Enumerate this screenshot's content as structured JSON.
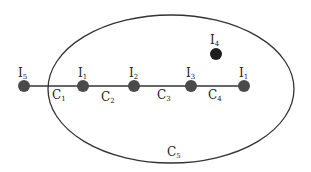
{
  "diagram": {
    "colors": {
      "stroke": "#333333",
      "node_fill": "#4a4a4a",
      "node_fill_dark": "#1e1e1e",
      "background": "#ffffff"
    },
    "ellipse": {
      "cx": 171,
      "cy": 89,
      "rx": 123,
      "ry": 74,
      "label_main": "C",
      "label_sub": "5"
    },
    "line": {
      "x1": 24,
      "y1": 86,
      "x2": 244,
      "y2": 86
    },
    "nodes": [
      {
        "id": "I5",
        "main": "I",
        "sub": "5",
        "x": 24,
        "y": 86
      },
      {
        "id": "I1a",
        "main": "I",
        "sub": "1",
        "x": 83,
        "y": 86
      },
      {
        "id": "I2",
        "main": "I",
        "sub": "2",
        "x": 134,
        "y": 86
      },
      {
        "id": "I3",
        "main": "I",
        "sub": "3",
        "x": 191,
        "y": 86
      },
      {
        "id": "I1b",
        "main": "I",
        "sub": "1",
        "x": 244,
        "y": 86
      },
      {
        "id": "I4",
        "main": "I",
        "sub": "4",
        "x": 216,
        "y": 54
      }
    ],
    "edges": [
      {
        "main": "C",
        "sub": "1"
      },
      {
        "main": "C",
        "sub": "2"
      },
      {
        "main": "C",
        "sub": "3"
      },
      {
        "main": "C",
        "sub": "4"
      }
    ]
  }
}
